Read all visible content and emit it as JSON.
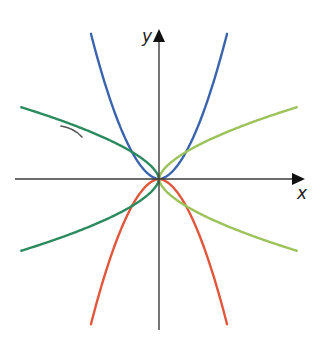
{
  "diagram": {
    "type": "graph-of-functions",
    "origin_px": [
      159,
      179
    ],
    "unit_px": 27,
    "axes": {
      "x": {
        "label": "x",
        "from_px": 15,
        "to_px": 305,
        "label_pos": [
          297,
          199
        ]
      },
      "y": {
        "label": "y",
        "from_px": 330,
        "to_px": 29,
        "label_pos": [
          142,
          42
        ]
      },
      "color": "#2e2e2e"
    },
    "curves": [
      {
        "name": "blue-parabola-up",
        "color": "#3a64ad",
        "sign": 1,
        "power": 1.82,
        "x_range": [
          -2.52,
          2.52
        ],
        "side": "both"
      },
      {
        "name": "red-parabola-down",
        "color": "#e2563c",
        "sign": -1,
        "power": 1.82,
        "x_range": [
          -2.52,
          2.52
        ],
        "side": "both"
      },
      {
        "name": "dark-green-left-upper",
        "color": "#2b8a5e",
        "sign": 1,
        "power": 0.6,
        "x_range": [
          -5.1,
          0
        ],
        "side": "left"
      },
      {
        "name": "dark-green-left-lower",
        "color": "#2b8a5e",
        "sign": -1,
        "power": 0.6,
        "x_range": [
          -5.1,
          0
        ],
        "side": "left"
      },
      {
        "name": "light-green-right-upper",
        "color": "#9cc25a",
        "sign": 1,
        "power": 0.6,
        "x_range": [
          0,
          5.1
        ],
        "side": "right"
      },
      {
        "name": "light-green-right-lower",
        "color": "#9cc25a",
        "sign": -1,
        "power": 0.6,
        "x_range": [
          0,
          5.1
        ],
        "side": "right"
      }
    ],
    "annotation_mark": {
      "name": "pen-mark",
      "color": "#555555"
    }
  }
}
